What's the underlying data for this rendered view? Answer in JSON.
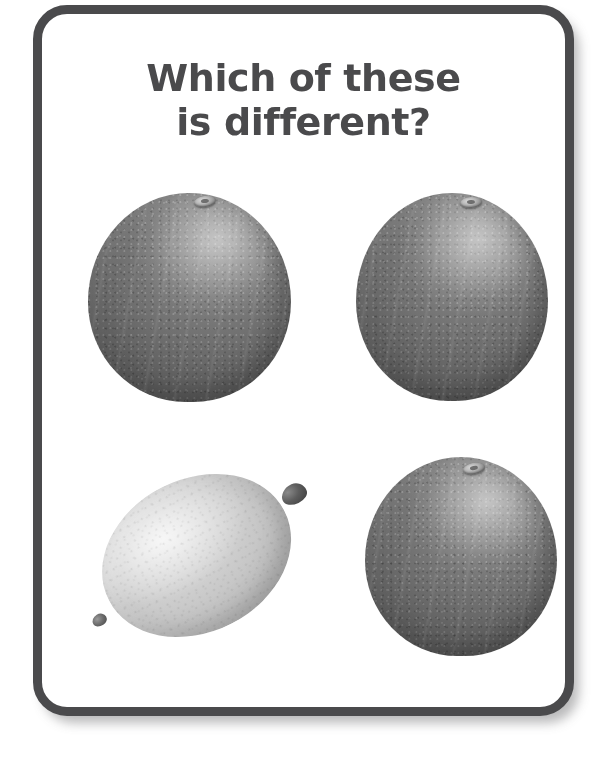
{
  "card": {
    "name": "worksheet-card",
    "background_color": "#ffffff",
    "border_color": "#4a4a4c",
    "border_width_px": 9,
    "corner_radius_px": 34,
    "shadow": "soft drop shadow toward bottom-right"
  },
  "title": {
    "full_text": "Which of these is different?",
    "lines": [
      "Which of these",
      "is different?"
    ],
    "color": "#4a4a4c",
    "align": "center",
    "weight": "bold"
  },
  "fruit_grid": {
    "rows": 2,
    "columns": 2,
    "items": [
      {
        "position": "top-left",
        "label": "orange",
        "icon_name": "orange-fruit-icon",
        "is_odd_one_out": false,
        "shape": "round",
        "tone": "dark-gray",
        "fill_color": "#6e6e6e",
        "has_stem_scar": true
      },
      {
        "position": "top-right",
        "label": "orange",
        "icon_name": "orange-fruit-icon",
        "is_odd_one_out": false,
        "shape": "round",
        "tone": "dark-gray",
        "fill_color": "#6e6e6e",
        "has_stem_scar": true
      },
      {
        "position": "bottom-left",
        "label": "lemon",
        "icon_name": "lemon-fruit-icon",
        "is_odd_one_out": true,
        "shape": "oval",
        "tone": "light-gray",
        "fill_color": "#c6c6c6",
        "has_stem_scar": false,
        "rotation_deg": -27
      },
      {
        "position": "bottom-right",
        "label": "orange",
        "icon_name": "orange-fruit-icon",
        "is_odd_one_out": false,
        "shape": "round",
        "tone": "dark-gray",
        "fill_color": "#6e6e6e",
        "has_stem_scar": true
      }
    ]
  }
}
